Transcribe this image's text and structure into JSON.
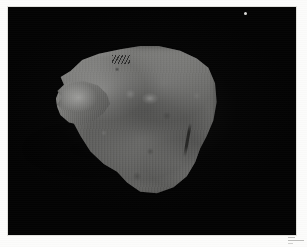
{
  "document": {
    "kind": "scanned-photographic-plate",
    "orientation": "landscape",
    "color_mode": "grayscale"
  },
  "page": {
    "width": 307,
    "height": 247,
    "paper_color": "#fcfcfb",
    "margin_px": 8
  },
  "plate": {
    "name": "photographic-plate",
    "background_color": "#030303",
    "left": 8,
    "top": 7,
    "width": 288,
    "height": 228,
    "border_color": "#e2e2de"
  },
  "specimen": {
    "label": "rock specimen",
    "description": "irregular angular fragment photographed against a black background",
    "highlight_color": "#fffffd",
    "midtone_color": "#9e9e9b",
    "shadow_color": "#5d5d5b",
    "left": 54,
    "top": 43,
    "width": 166,
    "height": 155,
    "features": [
      {
        "name": "protruding-lobe",
        "position": "left"
      },
      {
        "name": "bright-highlight",
        "position": "upper-center"
      },
      {
        "name": "fracture-line",
        "position": "right-flank"
      },
      {
        "name": "chisel-marks",
        "position": "top-edge"
      },
      {
        "name": "vertical-striations",
        "position": "overall"
      }
    ]
  },
  "artifacts": {
    "dust_speck": {
      "label": "white dust speck",
      "x": 244,
      "y": 5
    },
    "caption_mark": {
      "label": "illegible grey caption mark",
      "corner": "bottom-right"
    }
  }
}
